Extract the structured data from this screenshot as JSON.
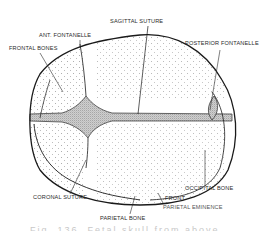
{
  "figure": {
    "labels": {
      "sagittal_suture": "SAGITTAL SUTURE",
      "anterior_fontanelle": "ANT. FONTANELLE",
      "frontal_bones": "FRONTAL BONES",
      "posterior_fontanelle": "POSTERIOR FONTANELLE",
      "coronal_suture": "CORONAL SUTURE",
      "parietal_bone": "PARIETAL BONE",
      "occipital_bone": "OCCIPITAL BONE",
      "frontal_eminence_partial": "FRONT.",
      "parietal_eminence": "PARIETAL EMINENCE"
    },
    "caption_partial": "Fig. 136. Fetal skull from above"
  },
  "colors": {
    "line": "#1a1a1a",
    "stipple": "#555555",
    "fontanelle_fill": "#9a9a9a",
    "background": "#ffffff"
  }
}
